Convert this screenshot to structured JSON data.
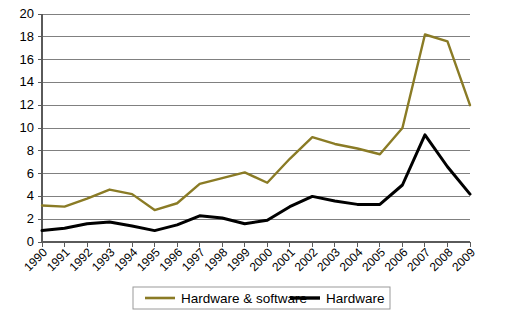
{
  "chart_data": {
    "type": "line",
    "title": "",
    "xlabel": "",
    "ylabel": "",
    "grid": true,
    "legend_position": "bottom",
    "ylim": [
      0,
      20
    ],
    "ytick_values": [
      0,
      2,
      4,
      6,
      8,
      10,
      12,
      14,
      16,
      18,
      20
    ],
    "ytick_labels": [
      "0",
      "2",
      "4",
      "6",
      "8",
      "10",
      "12",
      "14",
      "16",
      "18",
      "20"
    ],
    "categories": [
      "1990",
      "1991",
      "1992",
      "1993",
      "1994",
      "1995",
      "1996",
      "1997",
      "1998",
      "1999",
      "2000",
      "2001",
      "2002",
      "2003",
      "2004",
      "2005",
      "2006",
      "2007",
      "2008",
      "2009"
    ],
    "series": [
      {
        "name": "Hardware & software",
        "color": "#8a7b25",
        "values": [
          3.2,
          3.1,
          3.8,
          4.6,
          4.2,
          2.8,
          3.4,
          5.1,
          5.6,
          6.1,
          5.2,
          7.3,
          9.2,
          8.6,
          8.2,
          7.7,
          10.0,
          18.2,
          17.6,
          12.0
        ]
      },
      {
        "name": "Hardware",
        "color": "#000000",
        "values": [
          1.0,
          1.2,
          1.6,
          1.75,
          1.4,
          1.0,
          1.5,
          2.3,
          2.1,
          1.6,
          1.9,
          3.1,
          4.0,
          3.6,
          3.3,
          3.3,
          5.0,
          9.4,
          6.6,
          4.2
        ]
      }
    ],
    "legend": [
      {
        "label": "Hardware & software",
        "color": "#8a7b25"
      },
      {
        "label": "Hardware",
        "color": "#000000"
      }
    ]
  }
}
